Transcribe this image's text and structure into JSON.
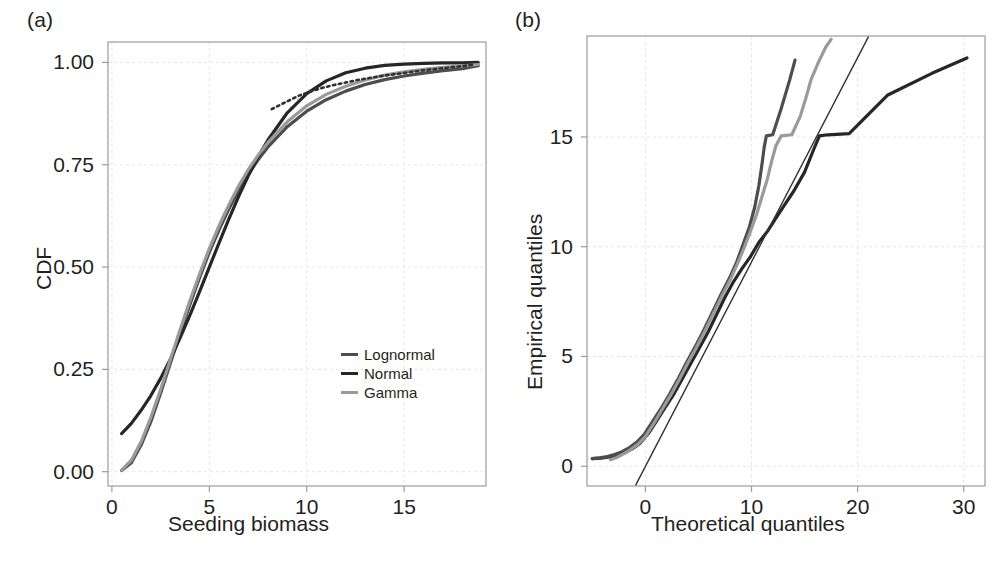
{
  "figure": {
    "background": "#ffffff",
    "panels": [
      {
        "tag": "(a)"
      },
      {
        "tag": "(b)"
      }
    ]
  },
  "colors": {
    "lognormal": "#4d4d4d",
    "normal": "#262626",
    "gamma": "#9a9a9a",
    "reference_line": "#333333",
    "axis": "#9b9b9b",
    "grid": "#e6e6e6",
    "text": "#231f20"
  },
  "panel_a": {
    "label": "(a)",
    "xlabel": "Seeding biomass",
    "ylabel": "CDF",
    "xticks": [
      "0",
      "5",
      "10",
      "15"
    ],
    "yticks": [
      "0.00",
      "0.25",
      "0.50",
      "0.75",
      "1.00"
    ],
    "legend": [
      {
        "label": "Lognormal",
        "color": "#4d4d4d"
      },
      {
        "label": "Normal",
        "color": "#262626"
      },
      {
        "label": "Gamma",
        "color": "#9a9a9a"
      }
    ]
  },
  "panel_b": {
    "label": "(b)",
    "xlabel": "Theoretical quantiles",
    "ylabel": "Empirical quantiles",
    "xticks": [
      "0",
      "10",
      "20",
      "30"
    ],
    "yticks": [
      "0",
      "5",
      "10",
      "15"
    ]
  },
  "chart_data": [
    {
      "type": "line",
      "panel": "(a)",
      "title": "",
      "xlabel": "Seeding biomass",
      "ylabel": "CDF",
      "xlim": [
        -0.2,
        19.2
      ],
      "ylim": [
        -0.035,
        1.05
      ],
      "xticks": [
        0,
        5,
        10,
        15
      ],
      "yticks": [
        0.0,
        0.25,
        0.5,
        0.75,
        1.0
      ],
      "grid": true,
      "legend": [
        "Lognormal",
        "Normal",
        "Gamma"
      ],
      "legend_position": "lower-right",
      "series": [
        {
          "name": "Lognormal",
          "color": "#4d4d4d",
          "x": [
            0.5,
            1.0,
            1.5,
            2.0,
            2.5,
            3.0,
            3.5,
            4.0,
            4.5,
            5.0,
            5.5,
            6.0,
            6.5,
            7.0,
            7.5,
            8.0,
            9.0,
            10.0,
            11.0,
            12.0,
            13.0,
            14.0,
            15.0,
            16.0,
            17.0,
            18.0,
            18.8
          ],
          "y": [
            0.003,
            0.022,
            0.065,
            0.122,
            0.192,
            0.265,
            0.337,
            0.408,
            0.474,
            0.536,
            0.591,
            0.642,
            0.687,
            0.727,
            0.762,
            0.793,
            0.843,
            0.881,
            0.909,
            0.93,
            0.946,
            0.958,
            0.967,
            0.974,
            0.98,
            0.985,
            0.992
          ]
        },
        {
          "name": "Normal",
          "color": "#262626",
          "x": [
            0.5,
            1.0,
            1.5,
            2.0,
            2.5,
            3.0,
            3.5,
            4.0,
            4.5,
            5.0,
            5.5,
            6.0,
            6.5,
            7.0,
            7.5,
            8.0,
            9.0,
            10.0,
            11.0,
            12.0,
            13.0,
            14.0,
            15.0,
            16.0,
            17.0,
            18.0,
            18.8
          ],
          "y": [
            0.093,
            0.118,
            0.15,
            0.186,
            0.228,
            0.275,
            0.327,
            0.382,
            0.44,
            0.5,
            0.559,
            0.617,
            0.672,
            0.723,
            0.769,
            0.81,
            0.877,
            0.924,
            0.955,
            0.975,
            0.986,
            0.993,
            0.996,
            0.998,
            0.999,
            0.999,
            1.0
          ]
        },
        {
          "name": "Gamma",
          "color": "#9a9a9a",
          "x": [
            0.5,
            1.0,
            1.5,
            2.0,
            2.5,
            3.0,
            3.5,
            4.0,
            4.5,
            5.0,
            5.5,
            6.0,
            6.5,
            7.0,
            7.5,
            8.0,
            9.0,
            10.0,
            11.0,
            12.0,
            13.0,
            14.0,
            15.0,
            16.0,
            17.0,
            18.0,
            18.8
          ],
          "y": [
            0.004,
            0.028,
            0.073,
            0.133,
            0.201,
            0.274,
            0.347,
            0.417,
            0.483,
            0.545,
            0.601,
            0.652,
            0.698,
            0.738,
            0.773,
            0.804,
            0.855,
            0.894,
            0.922,
            0.942,
            0.957,
            0.969,
            0.977,
            0.983,
            0.988,
            0.992,
            0.995
          ]
        },
        {
          "name": "Empirical",
          "color": "#303030",
          "dashed": true,
          "x": [
            8.2,
            9.0,
            9.6,
            10.2,
            10.8,
            11.4,
            12.0,
            12.6,
            13.2,
            14.0,
            14.8,
            15.4,
            16.2,
            17.0,
            17.8,
            18.6
          ],
          "y": [
            0.886,
            0.905,
            0.919,
            0.929,
            0.938,
            0.945,
            0.951,
            0.957,
            0.962,
            0.968,
            0.973,
            0.977,
            0.982,
            0.986,
            0.99,
            0.995
          ]
        }
      ]
    },
    {
      "type": "line",
      "panel": "(b)",
      "title": "",
      "xlabel": "Theoretical quantiles",
      "ylabel": "Empirical quantiles",
      "xlim": [
        -5.5,
        32.0
      ],
      "ylim": [
        -0.9,
        19.6
      ],
      "xticks": [
        0,
        10,
        20,
        30
      ],
      "yticks": [
        0,
        5,
        10,
        15
      ],
      "grid": true,
      "series": [
        {
          "name": "Normal",
          "color": "#262626",
          "x": [
            -5.0,
            -4.2,
            -3.4,
            -2.6,
            -1.9,
            -1.2,
            -0.5,
            0.3,
            1.1,
            1.9,
            2.7,
            3.5,
            4.3,
            5.1,
            5.9,
            6.7,
            7.5,
            8.3,
            9.1,
            9.9,
            10.7,
            11.5,
            12.3,
            13.1,
            14.0,
            15.0,
            16.0,
            16.4,
            17.2,
            19.2,
            22.8,
            27.0,
            30.3
          ],
          "y": [
            0.35,
            0.37,
            0.42,
            0.5,
            0.62,
            0.8,
            1.05,
            1.5,
            2.1,
            2.7,
            3.3,
            4.0,
            4.7,
            5.4,
            6.1,
            6.9,
            7.7,
            8.4,
            9.0,
            9.55,
            10.2,
            10.7,
            11.3,
            11.9,
            12.55,
            13.4,
            14.6,
            15.05,
            15.1,
            15.15,
            16.9,
            17.9,
            18.6
          ]
        },
        {
          "name": "Lognormal",
          "color": "#4d4d4d",
          "x": [
            -5.0,
            -4.3,
            -3.6,
            -2.9,
            -2.2,
            -1.5,
            -0.8,
            -0.1,
            0.7,
            1.5,
            2.3,
            3.1,
            3.9,
            4.7,
            5.5,
            6.3,
            7.1,
            7.9,
            8.6,
            9.2,
            9.8,
            10.3,
            10.7,
            11.0,
            11.2,
            11.4,
            12.0,
            12.8,
            13.6,
            14.1
          ],
          "y": [
            0.35,
            0.38,
            0.44,
            0.53,
            0.66,
            0.85,
            1.1,
            1.45,
            2.05,
            2.65,
            3.3,
            4.0,
            4.75,
            5.45,
            6.2,
            7.0,
            7.8,
            8.55,
            9.3,
            10.1,
            10.9,
            11.8,
            12.8,
            13.8,
            14.55,
            15.05,
            15.1,
            16.3,
            17.6,
            18.5
          ]
        },
        {
          "name": "Gamma",
          "color": "#9a9a9a",
          "x": [
            -3.3,
            -2.7,
            -2.1,
            -1.4,
            -0.7,
            0.0,
            0.8,
            1.6,
            2.4,
            3.2,
            4.0,
            4.8,
            5.6,
            6.4,
            7.2,
            8.0,
            8.7,
            9.3,
            9.9,
            10.5,
            11.0,
            11.5,
            11.9,
            12.3,
            12.8,
            13.8,
            14.6,
            15.2,
            15.6,
            16.3,
            17.0,
            17.5
          ],
          "y": [
            0.3,
            0.4,
            0.55,
            0.75,
            1.0,
            1.35,
            1.95,
            2.6,
            3.25,
            3.95,
            4.7,
            5.4,
            6.15,
            6.95,
            7.75,
            8.5,
            9.25,
            9.95,
            10.7,
            11.5,
            12.3,
            13.1,
            13.9,
            14.6,
            15.05,
            15.1,
            15.95,
            16.9,
            17.6,
            18.4,
            19.1,
            19.45
          ]
        },
        {
          "name": "Reference line",
          "color": "#333333",
          "thin": true,
          "x": [
            -0.9,
            21.0
          ],
          "y": [
            -0.85,
            19.55
          ]
        }
      ]
    }
  ]
}
